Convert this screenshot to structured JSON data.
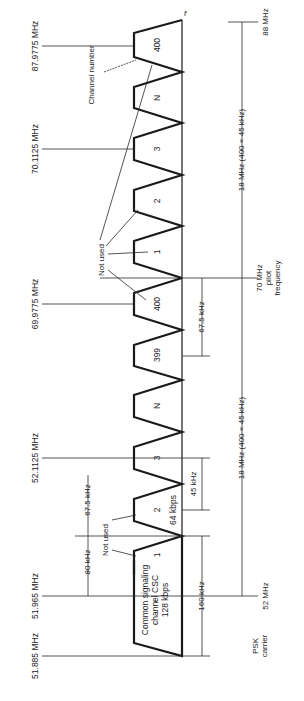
{
  "diagram": {
    "title": "",
    "orientation": "rotated 90° counter-clockwise (frequency increases upward)",
    "axis_label": "f",
    "frequency_labels": {
      "f_87_9775": "87.9775 MHz",
      "f_70_1125": "70.1125 MHz",
      "f_69_9775": "69.9775 MHz",
      "f_52_1125": "52.1125 MHz",
      "f_51_965": "51.965 MHz",
      "f_51_885": "51.885 MHz"
    },
    "channels_upper": [
      {
        "label": "400"
      },
      {
        "label": "N"
      },
      {
        "label": "3"
      },
      {
        "label": "2"
      },
      {
        "label": "1"
      }
    ],
    "channels_lower": [
      {
        "label": "400"
      },
      {
        "label": "399"
      },
      {
        "label": "N"
      },
      {
        "label": "3"
      },
      {
        "label": "2"
      },
      {
        "label": "1"
      }
    ],
    "annotations": {
      "channel_number": "Channel number",
      "not_used_upper": "Not used",
      "not_used_lower": "Not used",
      "csc_line1": "Common signaling",
      "csc_line2": "channel CSC",
      "csc_line3": "128 kbps",
      "rate_64": "64 kbps"
    },
    "dimensions": {
      "d_80k": "80 kHz",
      "d_67_5k_left": "67.5 kHz",
      "d_67_5k_right": "67.5 kHz",
      "d_45k": "45 kHz",
      "d_160k": "160 kHz",
      "span_upper": "18 MHz (400 × 45 kHz)",
      "span_lower": "18 MHz (400 × 45 kHz)"
    },
    "markers": {
      "top_freq": "88 MHz",
      "pilot_line1": "70 MHz",
      "pilot_line2": "pilot",
      "pilot_line3": "frequency",
      "psk_line1": "PSK",
      "psk_line2": "carrier",
      "bottom_freq": "52 MHz"
    }
  }
}
